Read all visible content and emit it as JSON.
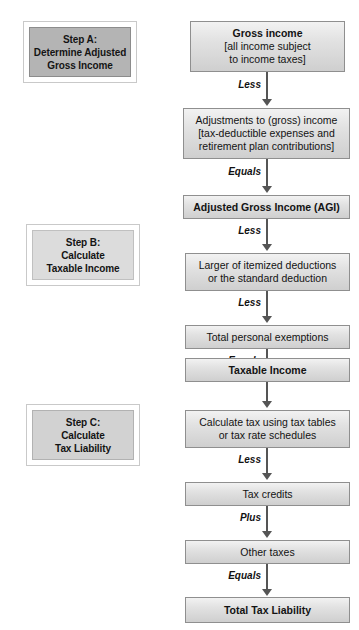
{
  "figure": {
    "title_cropped": "",
    "background": "#ffffff",
    "box_border": "#8f8f8f",
    "arrow_color": "#555555"
  },
  "steps": [
    {
      "id": "step-a",
      "shade": "dark",
      "lines": [
        "Step A:",
        "Determine Adjusted",
        "Gross Income"
      ]
    },
    {
      "id": "step-b",
      "shade": "light",
      "lines": [
        "Step B:",
        "Calculate",
        "Taxable Income"
      ]
    },
    {
      "id": "step-c",
      "shade": "mid",
      "lines": [
        "Step C:",
        "Calculate",
        "Tax Liability"
      ]
    }
  ],
  "flow": {
    "nodes": [
      {
        "id": "gross-income",
        "lines": [
          "Gross income",
          "[all income subject",
          "to income taxes]"
        ],
        "bold_lines": [
          true,
          false,
          false
        ]
      },
      {
        "id": "adjustments",
        "lines": [
          "Adjustments to (gross) income",
          "[tax-deductible expenses and",
          "retirement plan contributions]"
        ],
        "bold_lines": [
          false,
          false,
          false
        ]
      },
      {
        "id": "agi",
        "lines": [
          "Adjusted Gross Income (AGI)"
        ],
        "bold_lines": [
          true
        ]
      },
      {
        "id": "deductions",
        "lines": [
          "Larger of itemized deductions",
          "or the standard deduction"
        ],
        "bold_lines": [
          false,
          false
        ]
      },
      {
        "id": "exemptions",
        "lines": [
          "Total personal exemptions"
        ],
        "bold_lines": [
          false
        ]
      },
      {
        "id": "taxable-income",
        "lines": [
          "Taxable Income"
        ],
        "bold_lines": [
          true
        ]
      },
      {
        "id": "calculate-tax",
        "lines": [
          "Calculate tax using tax tables",
          "or tax rate schedules"
        ],
        "bold_lines": [
          false,
          false
        ]
      },
      {
        "id": "tax-credits",
        "lines": [
          "Tax credits"
        ],
        "bold_lines": [
          false
        ]
      },
      {
        "id": "other-taxes",
        "lines": [
          "Other taxes"
        ],
        "bold_lines": [
          false
        ]
      },
      {
        "id": "total-tax-liability",
        "lines": [
          "Total Tax Liability"
        ],
        "bold_lines": [
          true
        ]
      }
    ],
    "connectors": [
      {
        "id": "c1",
        "label": "Less",
        "from": "gross-income",
        "to": "adjustments"
      },
      {
        "id": "c2",
        "label": "Equals",
        "from": "adjustments",
        "to": "agi"
      },
      {
        "id": "c3",
        "label": "Less",
        "from": "agi",
        "to": "deductions"
      },
      {
        "id": "c4",
        "label": "Less",
        "from": "deductions",
        "to": "exemptions"
      },
      {
        "id": "c5",
        "label": "Equals",
        "from": "exemptions",
        "to": "taxable-income"
      },
      {
        "id": "c6",
        "label": "",
        "from": "taxable-income",
        "to": "calculate-tax"
      },
      {
        "id": "c7",
        "label": "Less",
        "from": "calculate-tax",
        "to": "tax-credits"
      },
      {
        "id": "c8",
        "label": "Plus",
        "from": "tax-credits",
        "to": "other-taxes"
      },
      {
        "id": "c9",
        "label": "Equals",
        "from": "other-taxes",
        "to": "total-tax-liability"
      }
    ]
  }
}
